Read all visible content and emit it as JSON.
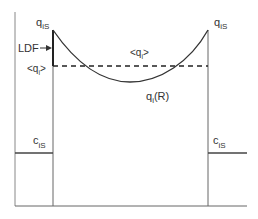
{
  "diagram": {
    "labels": {
      "q_is_left": {
        "base": "q",
        "sub": "iS"
      },
      "q_is_right": {
        "base": "q",
        "sub": "iS"
      },
      "ldf": "LDF",
      "qi_avg_left": {
        "pre": "<q",
        "sub": "i",
        "post": ">"
      },
      "qi_avg_center": {
        "pre": "<q",
        "sub": "i",
        "post": ">"
      },
      "qi_r": {
        "base": "q",
        "sub": "i",
        "post": "(R)"
      },
      "c_is_left": {
        "base": "c",
        "sub": "iS"
      },
      "c_is_right": {
        "base": "c",
        "sub": "iS"
      }
    },
    "colors": {
      "line": "#555555",
      "curve": "#333333",
      "text": "#333333"
    }
  }
}
